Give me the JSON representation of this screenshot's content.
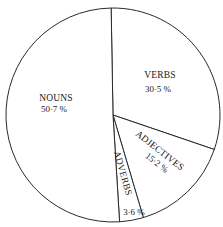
{
  "chart_data": {
    "type": "pie",
    "title": "",
    "categories": [
      "NOUNS",
      "VERBS",
      "ADJECTIVES",
      "ADVERBS"
    ],
    "values": [
      50.7,
      30.5,
      15.2,
      3.6
    ],
    "value_labels": [
      "50·7 %",
      "30·5 %",
      "15·2 %",
      "3·6 %"
    ],
    "unit": "%",
    "legend": "none (labels inside slices)",
    "slice_order_clockwise_from_top": [
      "VERBS",
      "ADJECTIVES",
      "ADVERBS",
      "NOUNS"
    ],
    "colors": {
      "fill": "#ffffff",
      "stroke": "#2a2a2a",
      "text": "#1a1a1a"
    }
  },
  "layout": {
    "cx": 113,
    "cy": 115,
    "r": 107,
    "start_angle_deg": -91
  },
  "labels": {
    "nouns": {
      "name": "NOUNS",
      "value": "50·7 %"
    },
    "verbs": {
      "name": "VERBS",
      "value": "30·5 %"
    },
    "adjectives": {
      "name": "ADJECTIVES",
      "value": "15·2 %"
    },
    "adverbs": {
      "name": "ADVERBS",
      "value": "3·6 %"
    }
  }
}
